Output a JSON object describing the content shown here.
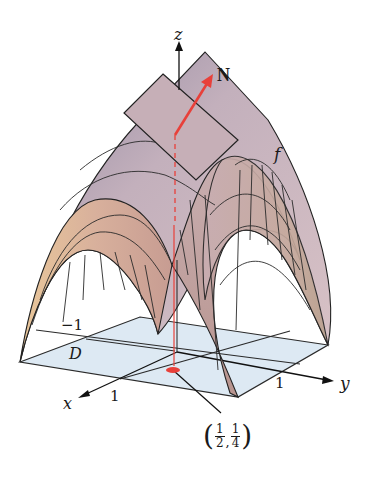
{
  "figure": {
    "labels": {
      "z_axis": "z",
      "x_axis": "x",
      "y_axis": "y",
      "normal_vector": "N",
      "surface": "f",
      "domain": "D",
      "tick_neg1": "−1",
      "tick_x1": "1",
      "tick_y1": "1",
      "point_x_num": "1",
      "point_x_den": "2",
      "point_y_num": "1",
      "point_y_den": "4",
      "point_sep": ",",
      "paren_open": "(",
      "paren_close": ")"
    },
    "colors": {
      "surface_top": "#c9b4bd",
      "surface_front": "#d7b09c",
      "surface_light": "#e8c4a4",
      "surface_shadow": "#8e8298",
      "tangent_plane": "#c8b0b8",
      "domain_fill": "#dde9f3",
      "grid_line": "#2a2a2a",
      "normal_vector": "#e8403a",
      "axis": "#111111"
    }
  }
}
